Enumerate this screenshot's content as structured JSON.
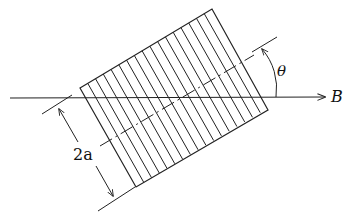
{
  "diagram": {
    "labels": {
      "field": "B",
      "angle": "θ",
      "width": "2a"
    },
    "colors": {
      "stroke": "#222222",
      "background": "#ffffff"
    },
    "hatch_count": 17
  }
}
